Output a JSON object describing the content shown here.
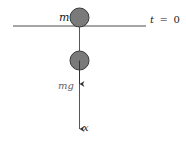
{
  "diagram": {
    "type": "free-fall-mechanics",
    "labels": {
      "mass": "m",
      "time_left": "t",
      "time_eq": "=",
      "time_value": "0",
      "force": "mg",
      "axis": "x"
    },
    "colors": {
      "line": "#4a4a4a",
      "ball_fill": "#7a7a7a",
      "ball_stroke": "#3a3a3a",
      "text": "#222222",
      "force_text": "#666666"
    },
    "elements": {
      "reference_line": {
        "x1": 13,
        "x2": 146,
        "y": 26
      },
      "ball_initial": {
        "cx": 79.5,
        "cy": 17.5,
        "r": 9.5
      },
      "ball_falling": {
        "cx": 79.5,
        "cy": 60.5,
        "r": 9.5
      },
      "force_arrow": {
        "x": 79.5,
        "y1": 60.5,
        "y2": 85
      },
      "axis_arrow": {
        "x": 79.5,
        "y1": 27,
        "y2": 130
      }
    }
  }
}
